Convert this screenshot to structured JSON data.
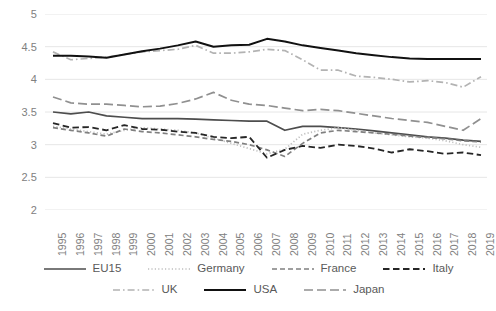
{
  "chart_data": {
    "type": "line",
    "title": "",
    "xlabel": "",
    "ylabel": "",
    "grid": true,
    "legend_position": "bottom",
    "ylim": [
      2,
      5
    ],
    "yticks": [
      2,
      2.5,
      3,
      3.5,
      4,
      4.5,
      5
    ],
    "ytick_labels": [
      "2",
      "2.5",
      "3",
      "3.5",
      "4",
      "4.5",
      "5"
    ],
    "x": [
      1995,
      1996,
      1997,
      1998,
      1999,
      2000,
      2001,
      2002,
      2003,
      2004,
      2005,
      2006,
      2007,
      2008,
      2009,
      2010,
      2011,
      2012,
      2013,
      2014,
      2015,
      2016,
      2017,
      2018,
      2019
    ],
    "xtick_labels": [
      "1995",
      "1996",
      "1997",
      "1998",
      "1999",
      "2000",
      "2001",
      "2002",
      "2003",
      "2004",
      "2005",
      "2006",
      "2007",
      "2008",
      "2009",
      "2010",
      "2011",
      "2012",
      "2013",
      "2014",
      "2015",
      "2016",
      "2017",
      "2018",
      "2019"
    ],
    "series": [
      {
        "name": "EU15",
        "style": "solid",
        "color": "#4d4d4d",
        "width": 1.7,
        "values": [
          3.5,
          3.47,
          3.5,
          3.44,
          3.42,
          3.4,
          3.4,
          3.4,
          3.39,
          3.38,
          3.37,
          3.36,
          3.36,
          3.22,
          3.28,
          3.28,
          3.26,
          3.24,
          3.21,
          3.18,
          3.15,
          3.12,
          3.1,
          3.07,
          3.05
        ]
      },
      {
        "name": "Germany",
        "style": "dotted",
        "color": "#bfbfbf",
        "width": 1.7,
        "values": [
          3.28,
          3.24,
          3.2,
          3.16,
          3.22,
          3.26,
          3.24,
          3.22,
          3.18,
          3.1,
          3.02,
          2.94,
          2.86,
          2.93,
          3.16,
          3.22,
          3.26,
          3.22,
          3.18,
          3.15,
          3.12,
          3.1,
          3.06,
          3.0,
          2.96
        ]
      },
      {
        "name": "France",
        "style": "dashed-med",
        "color": "#808080",
        "width": 1.7,
        "values": [
          3.26,
          3.22,
          3.18,
          3.13,
          3.24,
          3.2,
          3.18,
          3.15,
          3.12,
          3.08,
          3.05,
          3.0,
          2.92,
          2.82,
          3.02,
          3.18,
          3.22,
          3.2,
          3.18,
          3.16,
          3.13,
          3.11,
          3.09,
          3.06,
          3.04
        ]
      },
      {
        "name": "Italy",
        "style": "dashed-dark",
        "color": "#262626",
        "width": 1.8,
        "values": [
          3.33,
          3.26,
          3.27,
          3.22,
          3.3,
          3.24,
          3.23,
          3.2,
          3.18,
          3.12,
          3.1,
          3.12,
          2.8,
          2.92,
          2.98,
          2.95,
          3.0,
          2.98,
          2.94,
          2.88,
          2.93,
          2.9,
          2.86,
          2.88,
          2.84
        ]
      },
      {
        "name": "UK",
        "style": "dash-dot-light",
        "color": "#b3b3b3",
        "width": 1.7,
        "values": [
          4.42,
          4.3,
          4.32,
          4.34,
          4.38,
          4.42,
          4.44,
          4.46,
          4.52,
          4.4,
          4.4,
          4.42,
          4.46,
          4.44,
          4.3,
          4.14,
          4.14,
          4.05,
          4.03,
          4.0,
          3.96,
          3.98,
          3.95,
          3.88,
          4.04
        ]
      },
      {
        "name": "USA",
        "style": "solid-black",
        "color": "#111111",
        "width": 2.0,
        "values": [
          4.36,
          4.36,
          4.35,
          4.33,
          4.38,
          4.43,
          4.47,
          4.52,
          4.58,
          4.5,
          4.52,
          4.53,
          4.62,
          4.58,
          4.52,
          4.48,
          4.44,
          4.4,
          4.37,
          4.34,
          4.32,
          4.31,
          4.31,
          4.31,
          4.31
        ]
      },
      {
        "name": "Japan",
        "style": "dashed-long-gray",
        "color": "#909090",
        "width": 1.7,
        "values": [
          3.73,
          3.64,
          3.62,
          3.62,
          3.6,
          3.58,
          3.59,
          3.63,
          3.7,
          3.8,
          3.68,
          3.62,
          3.6,
          3.56,
          3.52,
          3.54,
          3.52,
          3.48,
          3.44,
          3.4,
          3.37,
          3.34,
          3.28,
          3.22,
          3.4
        ]
      }
    ]
  },
  "legend": {
    "items": [
      {
        "label": "EU15",
        "series": "EU15"
      },
      {
        "label": "Germany",
        "series": "Germany"
      },
      {
        "label": "France",
        "series": "France"
      },
      {
        "label": "Italy",
        "series": "Italy"
      },
      {
        "label": "UK",
        "series": "UK"
      },
      {
        "label": "USA",
        "series": "USA"
      },
      {
        "label": "Japan",
        "series": "Japan"
      }
    ]
  },
  "colors": {
    "gridline": "#e6e6e6",
    "tick_text": "#808080",
    "legend_text": "#595959",
    "background": "#ffffff"
  }
}
